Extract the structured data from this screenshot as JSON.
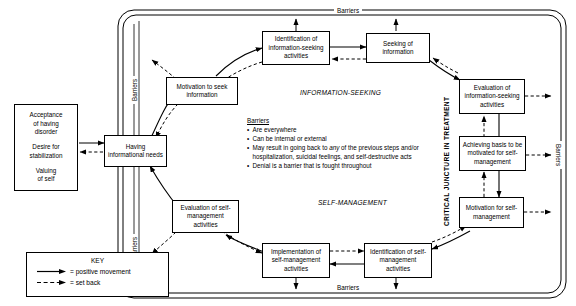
{
  "diagram": {
    "section_labels": {
      "information_seeking": "INFORMATION-SEEKING",
      "self_management": "SELF-MANAGEMENT",
      "critical_juncture": "CRITICAL JUNCTURE IN TREATMENT"
    },
    "barrier_labels": {
      "top": "Barriers",
      "bottom": "Barriers",
      "left_upper": "Barriers",
      "left_lower": "Barriers",
      "right": "Barriers"
    },
    "antecedents": {
      "line1": "Acceptance",
      "line2": "of having",
      "line3": "disorder",
      "line4": "Desire for",
      "line5": "stabilization",
      "line6": "Valuing",
      "line7": "of self",
      "item1": "Acceptance of having disorder",
      "item2": "Desire for stabilization",
      "item3": "Valuing of self"
    },
    "nodes": {
      "having_needs": "Having informational needs",
      "motivation_seek": "Motivation to seek information",
      "identification_info": "Identification of information-seeking activities",
      "seeking_info": "Seeking of information",
      "evaluation_info": "Evaluation of information-seeking activities",
      "achieving_basis": "Achieving basis to be motivated for self-management",
      "motivation_self": "Motivation for self-management",
      "identification_self": "Identification of self-management activities",
      "implementation_self": "Implementation of self-management activities",
      "evaluation_self": "Evaluation of self-management activities"
    },
    "barriers_note": {
      "title": "Barriers",
      "bullets": [
        "Are everywhere",
        "Can be internal or external",
        "May result in going back to any of the previous steps and/or hospitalization, suicidal feelings, and self-destructive acts",
        "Denial is a barrier that is fought throughout"
      ],
      "bullet3_pre": "May result in going back to ",
      "bullet3_ital": "any",
      "bullet3_post": " of the previous steps and/or hospitalization, suicidal feelings, and self-destructive acts"
    },
    "key": {
      "title": "KEY",
      "positive": "= positive movement",
      "setback": "= set back"
    },
    "colors": {
      "line": "#000000",
      "background": "#ffffff",
      "border": "#000000"
    }
  }
}
